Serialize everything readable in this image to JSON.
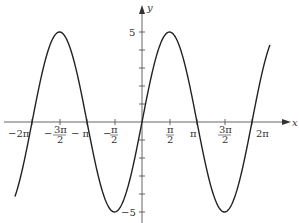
{
  "chart_data": {
    "type": "line",
    "title": "",
    "function": "y = 5 sin x",
    "xlabel": "x",
    "ylabel": "y",
    "xlim": [
      -7.26,
      7.31
    ],
    "ylim": [
      -5,
      5
    ],
    "grid": false,
    "legend": null,
    "x_ticks": [
      {
        "value": -6.2832,
        "label": "-2π"
      },
      {
        "value": -4.7124,
        "label": "-3π/2"
      },
      {
        "value": -3.1416,
        "label": "-π"
      },
      {
        "value": -1.5708,
        "label": "-π/2"
      },
      {
        "value": 1.5708,
        "label": "π/2"
      },
      {
        "value": 3.1416,
        "label": "π"
      },
      {
        "value": 4.7124,
        "label": "3π/2"
      },
      {
        "value": 6.2832,
        "label": "2π"
      }
    ],
    "y_ticks": [
      {
        "value": 5,
        "label": "5"
      },
      {
        "value": 4,
        "label": ""
      },
      {
        "value": 3,
        "label": ""
      },
      {
        "value": 2,
        "label": ""
      },
      {
        "value": 1,
        "label": ""
      },
      {
        "value": -1,
        "label": ""
      },
      {
        "value": -2,
        "label": ""
      },
      {
        "value": -3,
        "label": ""
      },
      {
        "value": -4,
        "label": ""
      },
      {
        "value": -5,
        "label": "-5"
      }
    ],
    "series": [
      {
        "name": "5 sin x",
        "x": [
          -7.26,
          -6.2832,
          -4.7124,
          -3.1416,
          -1.5708,
          0,
          1.5708,
          3.1416,
          4.7124,
          6.2832,
          7.31
        ],
        "y": [
          -4.2,
          0,
          5,
          0,
          -5,
          0,
          5,
          0,
          -5,
          0,
          4.3
        ]
      }
    ],
    "key_points": {
      "maxima": [
        [
          -4.7124,
          5
        ],
        [
          1.5708,
          5
        ]
      ],
      "minima": [
        [
          -1.5708,
          -5
        ],
        [
          4.7124,
          -5
        ]
      ],
      "zeros": [
        -6.2832,
        -3.1416,
        0,
        3.1416,
        6.2832
      ]
    }
  },
  "labels": {
    "x_axis": "x",
    "y_axis": "y",
    "y_max": "5",
    "y_min": "−5",
    "neg_two_pi": "−2π",
    "neg_three_halves_pi_num": "3π",
    "neg_three_halves_pi_den": "2",
    "neg_pi": "− π",
    "neg_half_pi_num": "π",
    "neg_half_pi_den": "2",
    "half_pi_num": "π",
    "half_pi_den": "2",
    "pi": "π",
    "three_halves_pi_num": "3π",
    "three_halves_pi_den": "2",
    "two_pi": "2π"
  },
  "colors": {
    "curve": "#222222",
    "axis": "#555555"
  }
}
